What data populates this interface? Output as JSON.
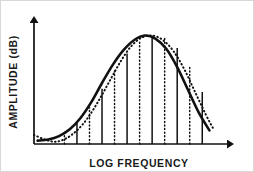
{
  "chart_data": {
    "type": "line",
    "title": "",
    "xlabel": "LOG FREQUENCY",
    "ylabel": "AMPLITUDE (dB)",
    "xlim": [
      0,
      100
    ],
    "ylim": [
      0,
      100
    ],
    "grid": false,
    "legend": "none",
    "axis_style": {
      "x_axis_arrow": true,
      "y_axis_arrow": true,
      "tick_labels": "none"
    },
    "series": [
      {
        "name": "solid-response-curve",
        "style": "solid",
        "color": "#111111",
        "linewidth": 2.6,
        "x": [
          2,
          8,
          14,
          20,
          26,
          32,
          38,
          44,
          50,
          56,
          62,
          68,
          74,
          80,
          86,
          92,
          98
        ],
        "y": [
          3,
          4,
          7,
          13,
          23,
          37,
          54,
          70,
          83,
          92,
          96,
          93,
          84,
          68,
          48,
          28,
          12
        ]
      },
      {
        "name": "dotted-response-curve",
        "style": "dotted",
        "color": "#111111",
        "linewidth": 2.0,
        "x": [
          0,
          6,
          12,
          18,
          24,
          30,
          36,
          42,
          48,
          54,
          60,
          66,
          72,
          78,
          84,
          90,
          96,
          100
        ],
        "y": [
          8,
          4,
          2,
          5,
          12,
          23,
          38,
          55,
          72,
          86,
          94,
          96,
          92,
          82,
          66,
          46,
          26,
          14
        ]
      }
    ],
    "vertical_bands": {
      "description": "alternating solid and dotted vertical band-edge lines rising from the x-axis to the solid curve",
      "count": 12,
      "x_positions": [
        17,
        24,
        31,
        38,
        45,
        52,
        59,
        66,
        73,
        80,
        87,
        94
      ],
      "styles": [
        "dotted",
        "solid",
        "dotted",
        "solid",
        "dotted",
        "solid",
        "dotted",
        "solid",
        "dotted",
        "solid",
        "dotted",
        "solid"
      ],
      "heights": [
        11,
        19,
        32,
        49,
        66,
        80,
        91,
        96,
        94,
        85,
        68,
        46
      ]
    },
    "colors": {
      "ink": "#111111",
      "background": "#ffffff",
      "frame": "#d8d8d8"
    }
  }
}
